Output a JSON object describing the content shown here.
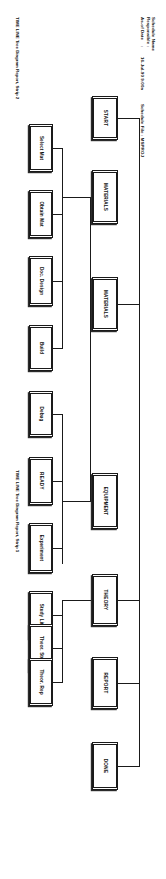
{
  "report": {
    "header": {
      "labels": [
        "Schedule Name",
        "Responsible",
        "As-of Date"
      ],
      "separators": [
        ":",
        ":",
        ":"
      ],
      "as_of_date": "16-Jul-90  9:00a",
      "schedule_file_label": "Schedule File  :  MSPROJ"
    },
    "footers": {
      "strip2": "TIME LINE Tree Diagram Report, Strip 2",
      "strip1": "TIME LINE Tree Diagram Report, Strip 1"
    },
    "nodes": {
      "start": "START",
      "materials_ms": "MATERIALS",
      "select_mat": "Select Mat",
      "obtain_mat": "Obtain Mat",
      "doc_design": "Doc. Design",
      "build": "Build",
      "materials_top": "MATERIALS",
      "equipment": "EQUIPMENT",
      "debug": "Debug",
      "ready": "READY",
      "experiment": "Experiment",
      "study_lit": "Study Lit.",
      "theory": "THEORY",
      "theor_stu": "Theor. Stu",
      "theor_rep": "Theor. Rep",
      "report": "REPORT",
      "done": "DONE"
    }
  }
}
